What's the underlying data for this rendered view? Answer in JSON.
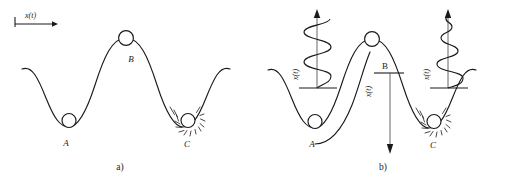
{
  "figure": {
    "panels": [
      {
        "id": "a",
        "caption": "a)",
        "axis_label": "x(t)",
        "points": [
          {
            "label": "A",
            "type": "stable-minimum"
          },
          {
            "label": "B",
            "type": "unstable-maximum"
          },
          {
            "label": "C",
            "type": "damped-minimum"
          }
        ]
      },
      {
        "id": "b",
        "caption": "b)",
        "traces": [
          {
            "at": "A",
            "axis_label": "x(t)",
            "kind": "sustained-oscillation"
          },
          {
            "at": "B",
            "axis_label": "x(t)",
            "kind": "divergence-down-arrow"
          },
          {
            "at": "C",
            "axis_label": "x(t)",
            "kind": "damped-oscillation"
          }
        ],
        "points": [
          {
            "label": "A",
            "type": "stable-minimum"
          },
          {
            "label": "B",
            "type": "unstable-maximum"
          },
          {
            "label": "C",
            "type": "damped-minimum"
          }
        ]
      }
    ],
    "colors": {
      "ink": "#1a1a1a",
      "paper": "#ffffff"
    }
  }
}
